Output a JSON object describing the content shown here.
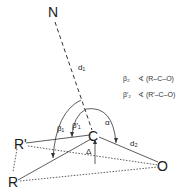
{
  "diagram": {
    "points": {
      "N": {
        "label": "N",
        "x": 55,
        "y": 12
      },
      "C": {
        "label": "C",
        "x": 94,
        "y": 135
      },
      "R_prime": {
        "label": "R'",
        "x": 22,
        "y": 144
      },
      "R": {
        "label": "R",
        "x": 13,
        "y": 182
      },
      "O": {
        "label": "O",
        "x": 163,
        "y": 165
      }
    },
    "labels": {
      "d1": "d₁",
      "d2": "d₂",
      "delta": "Δ",
      "alpha": "α",
      "beta1": "β₁",
      "beta1_prime": "β′₁"
    },
    "legend": [
      {
        "symbol": "β₂",
        "text": "∢ (R–C–O)"
      },
      {
        "symbol": "β′₂",
        "text": "∢ (R′–C–O)"
      }
    ],
    "colors": {
      "line": "#333333",
      "background": "#ffffff"
    }
  }
}
